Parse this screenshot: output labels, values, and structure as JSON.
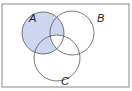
{
  "diagram": {
    "type": "venn",
    "sets": [
      {
        "label": "A",
        "cx": 43,
        "cy": 33,
        "r": 21
      },
      {
        "label": "B",
        "cx": 72,
        "cy": 33,
        "r": 22
      },
      {
        "label": "C",
        "cx": 57,
        "cy": 58,
        "r": 23
      }
    ],
    "shaded_region": "A minus (A∩B∩C)",
    "colors": {
      "shade": "#cdd6ef",
      "stroke": "#555555",
      "frame": "#888888"
    }
  }
}
